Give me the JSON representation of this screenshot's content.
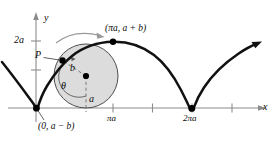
{
  "figure": {
    "kind": "curtate-cycloid-diagram",
    "axes": {
      "x_axis_label": "x",
      "y_axis_label": "y",
      "y_tick_labels": [
        "2a"
      ],
      "x_tick_labels": [
        "πa",
        "2πa"
      ],
      "x_unlabeled_tick_count": 2
    },
    "annotations": {
      "point_p_label": "P",
      "radius_outer_label": "a",
      "radius_point_label": "b",
      "angle_label": "θ",
      "top_point_coords": "(πa, a + b)",
      "origin_point_coords": "(0, a − b)"
    },
    "colors": {
      "curve": "#111111",
      "axis": "#8c8c8c",
      "circle_fill": "#dcdcdc",
      "circle_stroke": "#4d4d4d",
      "dashed_radius": "#6e6e6e",
      "rotation_arrow": "#9a9a9a",
      "point_dot": "#000000",
      "text": "#0a0a0a"
    },
    "geometry": {
      "circle_center_x": 86,
      "circle_center_y": 76,
      "circle_radius": 32,
      "x_axis_y": 108,
      "y_axis_x": 36,
      "tick_pi_a_x": 113,
      "tick_2pi_a_x": 192,
      "tick_2a_y": 41
    }
  }
}
